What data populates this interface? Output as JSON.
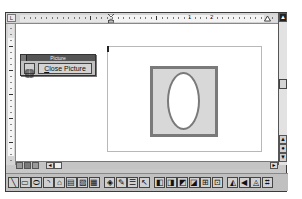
{
  "ruler": {
    "corner_icon": "tab-stop-left-icon",
    "corner_glyph": "L",
    "numbers": [
      {
        "label": "1",
        "x": 188
      },
      {
        "label": "2",
        "x": 210
      }
    ]
  },
  "picture_toolbar": {
    "title": "Picture",
    "reset_button_icon": "reset-picture-boundary-icon",
    "close_button_label_first": "C",
    "close_button_label_rest": "lose Picture"
  },
  "document": {
    "shapes": [
      {
        "type": "rectangle",
        "fill": "#d8d8d8",
        "stroke": "#7a7a7a"
      },
      {
        "type": "ellipse",
        "fill": "#ffffff",
        "stroke": "#7a7a7a"
      }
    ]
  },
  "vertical_scrollbar": {
    "up_arrow": "▲",
    "prev_page": "▲",
    "select_browse": "●",
    "next_page": "▼"
  },
  "view_buttons": [
    "normal-view",
    "page-layout-view",
    "outline-view"
  ],
  "horizontal_scrollbar": {
    "left_arrow": "◄",
    "right_arrow": "►"
  },
  "drawing_toolbar": {
    "groups": [
      {
        "items": [
          {
            "name": "line-tool",
            "glyph": "╲"
          },
          {
            "name": "rectangle-tool",
            "glyph": "▭"
          },
          {
            "name": "ellipse-tool",
            "glyph": "⬭"
          },
          {
            "name": "arc-tool",
            "glyph": "◝"
          },
          {
            "name": "freeform-tool",
            "glyph": "⌂"
          },
          {
            "name": "text-box-tool",
            "glyph": "▤"
          },
          {
            "name": "callout-tool",
            "glyph": "▨"
          },
          {
            "name": "format-callout-tool",
            "glyph": "▦"
          }
        ]
      },
      {
        "items": [
          {
            "name": "fill-color-tool",
            "glyph": "◈"
          },
          {
            "name": "line-color-tool",
            "glyph": "✎"
          },
          {
            "name": "line-style-tool",
            "glyph": "☰"
          },
          {
            "name": "select-drawing-objects-tool",
            "glyph": "↖"
          }
        ]
      },
      {
        "items": [
          {
            "name": "bring-to-front-tool",
            "glyph": "◧"
          },
          {
            "name": "send-to-back-tool",
            "glyph": "◨"
          },
          {
            "name": "bring-in-front-of-text-tool",
            "glyph": "◩"
          },
          {
            "name": "send-behind-text-tool",
            "glyph": "◪"
          },
          {
            "name": "group-tool",
            "glyph": "⊞"
          },
          {
            "name": "ungroup-tool",
            "glyph": "⊡"
          }
        ]
      },
      {
        "items": [
          {
            "name": "flip-horizontal-tool",
            "glyph": "◭"
          },
          {
            "name": "flip-vertical-tool",
            "glyph": "◀"
          },
          {
            "name": "rotate-right-tool",
            "glyph": "◬"
          },
          {
            "name": "reshape-tool",
            "glyph": "⌗"
          }
        ]
      }
    ]
  }
}
